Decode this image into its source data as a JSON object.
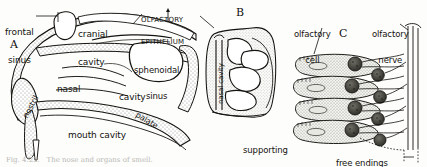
{
  "figure": {
    "caption": "Fig. 4.22.   The nose and organs of smell.",
    "background_color": "#fdfdfc",
    "ink_color": "#14130f",
    "stipple_color": "#8d8d86"
  },
  "panels": [
    {
      "id": "A",
      "name": "sagittal-section-of-head",
      "labels": [
        {
          "key": "frontal_sinus",
          "text": "frontal\nsinus"
        },
        {
          "key": "cranial_cavity",
          "text": "cranial\ncavity"
        },
        {
          "key": "olfactory_epithelium",
          "text": "OLFACTORY\nEPITHELIUM"
        },
        {
          "key": "sphenoidal_sinus",
          "text": "sphenoidal\nsinus"
        },
        {
          "key": "nasal",
          "text": "nasal"
        },
        {
          "key": "cavity",
          "text": "cavity"
        },
        {
          "key": "nostril",
          "text": "nostril"
        },
        {
          "key": "mouth_cavity",
          "text": "mouth cavity"
        },
        {
          "key": "palate",
          "text": "palate"
        }
      ]
    },
    {
      "id": "B",
      "name": "nasal-cavity-cross-section",
      "labels": [
        {
          "key": "nasal_cavity",
          "text": "nasal cavity"
        }
      ]
    },
    {
      "id": "C",
      "name": "olfactory-epithelium-cells",
      "labels": [
        {
          "key": "olfactory_cell",
          "text": "olfactory\ncell"
        },
        {
          "key": "olfactory_nerve",
          "text": "olfactory\nnerve"
        },
        {
          "key": "supporting_cell",
          "text": "supporting\ncell"
        },
        {
          "key": "free_endings",
          "text": "free endings\nof Vth nerve"
        }
      ]
    }
  ],
  "text": {
    "frontal_sinus_l1": "frontal",
    "frontal_sinus_l2": "sinus",
    "cranial_l1": "cranial",
    "cranial_l2": "cavity",
    "olf_epi_l1": "OLFACTORY",
    "olf_epi_l2": "EPITHELIUM",
    "sphenoidal_l1": "sphenoidal",
    "sphenoidal_l2": "sinus",
    "nasal": "nasal",
    "cavity": "cavity",
    "nostril": "nostril",
    "mouth_cavity": "mouth cavity",
    "palate": "palate",
    "nasal_cavity_b": "nasal cavity",
    "olf_cell_l1": "olfactory",
    "olf_cell_l2": "cell",
    "olf_nerve_l1": "olfactory",
    "olf_nerve_l2": "nerve",
    "supporting_l1": "supporting",
    "supporting_l2": "cell",
    "free_end_l1": "free endings",
    "free_end_l2": "of Vth nerve",
    "panel_a": "A",
    "panel_b": "B",
    "panel_c": "C",
    "caption": "Fig. 4.22.   The nose and organs of smell."
  }
}
